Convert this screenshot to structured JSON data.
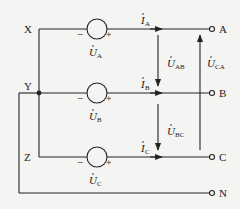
{
  "nodes": {
    "X": "X",
    "Y": "Y",
    "Z": "Z"
  },
  "terminals": {
    "A": "A",
    "B": "B",
    "C": "C",
    "N": "N"
  },
  "sources": [
    {
      "id": "A",
      "label": "U",
      "sub": "A",
      "minus": "−",
      "plus": "+"
    },
    {
      "id": "B",
      "label": "U",
      "sub": "B",
      "minus": "−",
      "plus": "+"
    },
    {
      "id": "C",
      "label": "U",
      "sub": "C",
      "minus": "−",
      "plus": "+"
    }
  ],
  "currents": [
    {
      "label": "I",
      "sub": "A"
    },
    {
      "label": "I",
      "sub": "B"
    },
    {
      "label": "I",
      "sub": "C"
    }
  ],
  "voltages": [
    {
      "label": "U",
      "sub": "AB"
    },
    {
      "label": "U",
      "sub": "BC"
    },
    {
      "label": "U",
      "sub": "CA"
    }
  ],
  "colors": {
    "line": "#222222",
    "background": "#f4f4f2"
  }
}
